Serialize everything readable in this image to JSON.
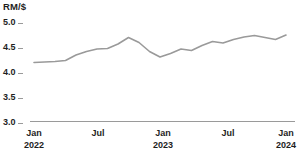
{
  "chart_data": {
    "type": "line",
    "title": "",
    "ylabel": "RM/$",
    "xlabel": "",
    "ylim": [
      3.0,
      5.0
    ],
    "grid": false,
    "legend": "none",
    "line_color": "#9a9a9a",
    "y_ticks": [
      "5.0",
      "4.5",
      "4.0",
      "3.5",
      "3.0"
    ],
    "y_tick_values": [
      5.0,
      4.5,
      4.0,
      3.5,
      3.0
    ],
    "x_ticks": [
      {
        "month": "Jan",
        "year": "2022"
      },
      {
        "month": "Jul",
        "year": ""
      },
      {
        "month": "Jan",
        "year": "2023"
      },
      {
        "month": "Jul",
        "year": ""
      },
      {
        "month": "Jan",
        "year": "2024"
      }
    ],
    "x": [
      "2022-01",
      "2022-02",
      "2022-03",
      "2022-04",
      "2022-05",
      "2022-06",
      "2022-07",
      "2022-08",
      "2022-09",
      "2022-10",
      "2022-11",
      "2022-12",
      "2023-01",
      "2023-02",
      "2023-03",
      "2023-04",
      "2023-05",
      "2023-06",
      "2023-07",
      "2023-08",
      "2023-09",
      "2023-10",
      "2023-11",
      "2023-12",
      "2024-01"
    ],
    "series": [
      {
        "name": "RM per USD",
        "values": [
          4.18,
          4.19,
          4.2,
          4.22,
          4.33,
          4.4,
          4.45,
          4.46,
          4.55,
          4.68,
          4.58,
          4.4,
          4.29,
          4.36,
          4.45,
          4.42,
          4.52,
          4.6,
          4.57,
          4.64,
          4.69,
          4.72,
          4.68,
          4.64,
          4.73
        ]
      }
    ]
  }
}
